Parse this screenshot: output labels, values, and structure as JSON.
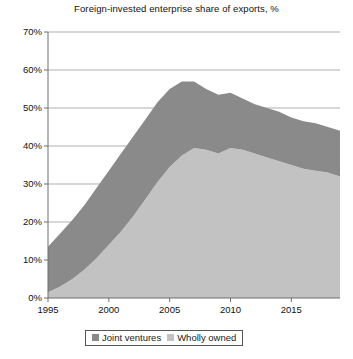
{
  "chart_data": {
    "type": "area",
    "stacked": true,
    "title": "Foreign-invested enterprise share of exports, %",
    "xlabel": "",
    "ylabel": "",
    "ylim": [
      0,
      70
    ],
    "xlim": [
      1995,
      2019
    ],
    "grid": true,
    "legend_position": "bottom",
    "ytick_labels": [
      "0%",
      "10%",
      "20%",
      "30%",
      "40%",
      "50%",
      "60%",
      "70%"
    ],
    "ytick_values": [
      0,
      10,
      20,
      30,
      40,
      50,
      60,
      70
    ],
    "xtick_labels": [
      "1995",
      "2000",
      "2005",
      "2010",
      "2015"
    ],
    "xtick_values": [
      1995,
      2000,
      2005,
      2010,
      2015
    ],
    "x": [
      1995,
      1996,
      1997,
      1998,
      1999,
      2000,
      2001,
      2002,
      2003,
      2004,
      2005,
      2006,
      2007,
      2008,
      2009,
      2010,
      2011,
      2012,
      2013,
      2014,
      2015,
      2016,
      2017,
      2018,
      2019
    ],
    "series": [
      {
        "name": "Wholly owned",
        "color": "#c2c2c2",
        "stack_order": 1,
        "values": [
          1.5,
          3.0,
          5.0,
          7.5,
          10.5,
          14.0,
          17.5,
          21.5,
          26.0,
          30.5,
          34.5,
          37.5,
          39.5,
          39.0,
          38.0,
          39.5,
          39.0,
          38.0,
          37.0,
          36.0,
          35.0,
          34.0,
          33.5,
          33.0,
          32.0
        ]
      },
      {
        "name": "Joint ventures",
        "color": "#8a8a8a",
        "stack_order": 2,
        "values": [
          12.0,
          14.0,
          15.5,
          17.0,
          18.5,
          19.5,
          20.5,
          21.0,
          21.0,
          21.0,
          20.5,
          19.5,
          17.5,
          16.0,
          15.5,
          14.5,
          13.5,
          13.0,
          13.0,
          13.0,
          12.5,
          12.5,
          12.5,
          12.0,
          12.0
        ]
      }
    ],
    "total": [
      13.5,
      17.0,
      20.5,
      24.5,
      29.0,
      33.5,
      38.0,
      42.5,
      47.0,
      51.5,
      55.0,
      57.0,
      57.0,
      55.0,
      53.5,
      54.0,
      52.5,
      51.0,
      50.0,
      49.0,
      47.5,
      46.5,
      46.0,
      45.0,
      44.0
    ]
  },
  "legend": {
    "items": [
      {
        "label": "Joint ventures",
        "color": "#8a8a8a"
      },
      {
        "label": "Wholly owned",
        "color": "#c2c2c2"
      }
    ]
  }
}
